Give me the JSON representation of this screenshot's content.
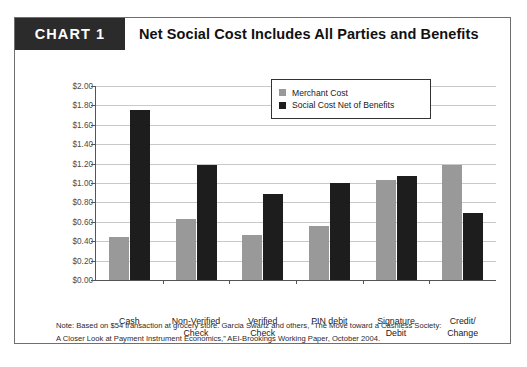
{
  "header": {
    "badge": "CHART 1",
    "title": "Net Social Cost Includes All Parties and Benefits"
  },
  "legend": {
    "items": [
      {
        "label": "Merchant Cost",
        "color": "#999999",
        "swatch": "square-gray-icon"
      },
      {
        "label": "Social Cost Net of Benefits",
        "color": "#1d1d1d",
        "swatch": "square-black-icon"
      }
    ]
  },
  "footnote": {
    "line1": "Note: Based on $54 transaction at grocery store. Garcia Swartz and others, “The Move toward a Cashless Society:",
    "line2": "A Closer Look at Payment Instrument Economics,” AEI-Brookings Working Paper, October 2004."
  },
  "chart_data": {
    "type": "bar",
    "title": "Net Social Cost Includes All Parties and Benefits",
    "xlabel": "",
    "ylabel": "",
    "ylim": [
      0,
      2.0
    ],
    "ytick_step": 0.2,
    "ytick_labels": [
      "$2.00",
      "$1.80",
      "$1.60",
      "$1.40",
      "$1.20",
      "$1.00",
      "$0.80",
      "$0.60",
      "$0.40",
      "$0.20",
      "$0.00"
    ],
    "ytick_values": [
      2.0,
      1.8,
      1.6,
      1.4,
      1.2,
      1.0,
      0.8,
      0.6,
      0.4,
      0.2,
      0.0
    ],
    "grid": true,
    "legend_position": "top-right-inside",
    "categories": [
      "Cash",
      "Non-Verified\nCheck",
      "Verified\nCheck",
      "PIN debit",
      "Signature\nDebit",
      "Credit/\nChange"
    ],
    "category_lines": [
      [
        "Cash"
      ],
      [
        "Non-Verified",
        "Check"
      ],
      [
        "Verified",
        "Check"
      ],
      [
        "PIN debit"
      ],
      [
        "Signature",
        "Debit"
      ],
      [
        "Credit/",
        "Change"
      ]
    ],
    "series": [
      {
        "name": "Merchant Cost",
        "color": "#999999",
        "values": [
          0.44,
          0.63,
          0.46,
          0.56,
          1.03,
          1.19
        ]
      },
      {
        "name": "Social Cost Net of Benefits",
        "color": "#1d1d1d",
        "values": [
          1.75,
          1.19,
          0.89,
          1.0,
          1.07,
          0.69
        ]
      }
    ]
  }
}
